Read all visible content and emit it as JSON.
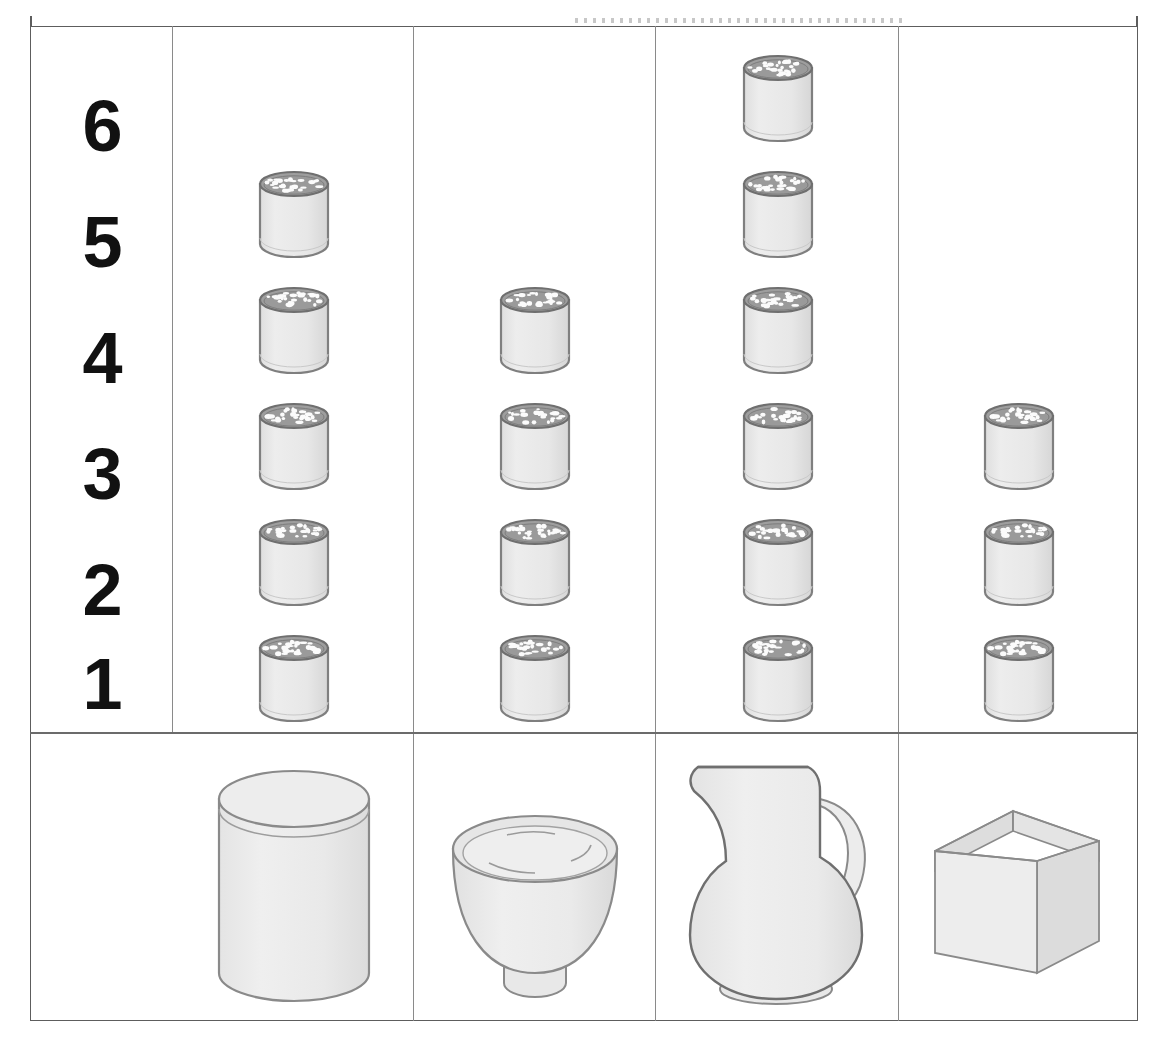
{
  "chart_data": {
    "type": "bar",
    "title": "",
    "subtitle": "",
    "xlabel": "",
    "ylabel": "",
    "categories": [
      "jar",
      "bowl",
      "pitcher",
      "box"
    ],
    "category_icons": [
      "cylindrical-jar",
      "footed-bowl",
      "pitcher",
      "open-box"
    ],
    "values": [
      5,
      4,
      6,
      3
    ],
    "unit": "glass",
    "ylim": [
      0,
      6
    ],
    "y_tick_labels": [
      "6",
      "5",
      "4",
      "3",
      "2",
      "1"
    ],
    "grid": false,
    "legend": null
  },
  "axis": {
    "labels": [
      "6",
      "5",
      "4",
      "3",
      "2",
      "1"
    ]
  },
  "columns": [
    {
      "id": "jar",
      "container_name": "cylindrical-jar",
      "count": 5,
      "icon": "glass-of-liquid"
    },
    {
      "id": "bowl",
      "container_name": "footed-bowl",
      "count": 4,
      "icon": "glass-of-liquid"
    },
    {
      "id": "pitcher",
      "container_name": "pitcher",
      "count": 6,
      "icon": "glass-of-liquid"
    },
    {
      "id": "box",
      "container_name": "open-box",
      "count": 3,
      "icon": "glass-of-liquid"
    }
  ],
  "colors": {
    "frame": "#5d5d5d",
    "divider": "#8a8a8a",
    "glass_fill": "#e9e9e9",
    "glass_outline": "#8b8b8b",
    "glass_rim": "#9a9a9a",
    "container_fill": "#ececec",
    "container_outline": "#8a8a8a",
    "label_text": "#111111",
    "background": "#ffffff"
  },
  "layout": {
    "axis_column_x": 30,
    "column_dividers_x": [
      172,
      413,
      655,
      898
    ],
    "body_divider_y": 732,
    "frame": {
      "x": 30,
      "y": 26,
      "w": 1108,
      "h": 995
    }
  }
}
